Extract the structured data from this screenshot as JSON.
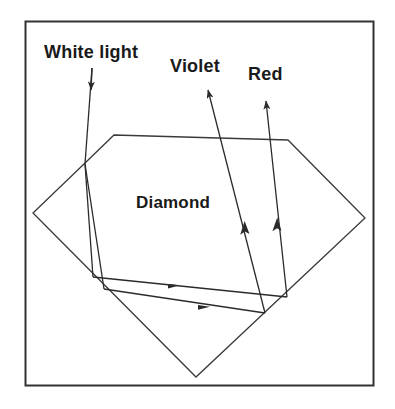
{
  "figure": {
    "kind": "physics-ray-diagram",
    "background_color": "#ffffff",
    "stroke_color": "#333333",
    "text_color": "#1a1a1a",
    "frame": {
      "name": "figure-border",
      "x": 25,
      "y": 21,
      "width": 349,
      "height": 365,
      "stroke_width": 2
    },
    "labels": {
      "white_light": "White light",
      "violet": "Violet",
      "red": "Red",
      "diamond": "Diamond"
    },
    "diamond_shape": {
      "name": "diamond-outline",
      "description": "brilliant-cut diamond cross section, rotated square with flat table",
      "points": "114,135 288,140 365,218 196,377 33,213 84,164"
    },
    "rays": [
      {
        "name": "white-light-ray",
        "label": "White light",
        "color": "#333333",
        "path": "92,68 91,90 85,164",
        "arrow_at": "91,88",
        "arrow_angle_deg": 93
      },
      {
        "name": "violet-ray-internal-down",
        "label": "Violet",
        "color": "#333333",
        "path": "85,164 104,289",
        "arrow_at": null
      },
      {
        "name": "red-ray-internal-down",
        "label": "Red",
        "color": "#333333",
        "path": "85,164 93,277",
        "arrow_at": null
      },
      {
        "name": "red-ray-internal-across",
        "label": "Red",
        "color": "#333333",
        "path": "93,277 287,297",
        "arrow_at": "175,285",
        "arrow_angle_deg": 6
      },
      {
        "name": "violet-ray-internal-across",
        "label": "Violet",
        "color": "#333333",
        "path": "104,289 265,313",
        "arrow_at": "205,307",
        "arrow_angle_deg": 8
      },
      {
        "name": "violet-ray-exit",
        "label": "Violet",
        "color": "#333333",
        "path": "265,313 208,90",
        "arrow_at_mid": "245,222",
        "arrow_at_tip": "208,90",
        "arrow_angle_deg": -104
      },
      {
        "name": "red-ray-exit",
        "label": "Red",
        "color": "#333333",
        "path": "287,297 266,101",
        "arrow_at_mid": "277,218",
        "arrow_at_tip": "266,101",
        "arrow_angle_deg": -96
      }
    ]
  }
}
